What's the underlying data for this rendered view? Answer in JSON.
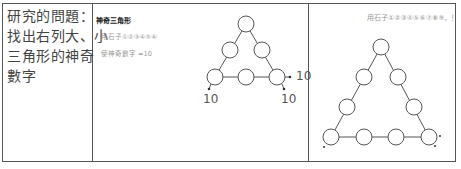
{
  "question": {
    "lines": [
      "研究的問題：",
      "找出右列大、小",
      "三角形的神奇",
      "數字"
    ]
  },
  "small_triangle": {
    "title": "神奇三角形",
    "line1": "用石子①②③④⑤⑥",
    "line2": "使神奇數字 =10",
    "side_labels": [
      "10",
      "10",
      "10"
    ]
  },
  "big_triangle": {
    "line1": "用石子①②③④⑤⑥⑦⑧⑨，！"
  }
}
